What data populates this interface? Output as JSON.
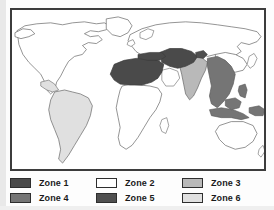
{
  "figure": {
    "type": "world-zone-map",
    "map": {
      "frame": true,
      "background_color": "#ffffff",
      "outline_color": "#555555"
    },
    "zone_colors": {
      "zone1": "#4a4a4a",
      "zone2": "#ffffff",
      "zone3": "#b9b9b9",
      "zone4": "#757575",
      "zone5": "#4f4f4f",
      "zone6": "#e0e0e0"
    },
    "regions": [
      {
        "name": "north-america",
        "zone": "zone2"
      },
      {
        "name": "greenland",
        "zone": "zone2"
      },
      {
        "name": "south-america",
        "zone": "zone6"
      },
      {
        "name": "central-america",
        "zone": "zone6"
      },
      {
        "name": "north-africa",
        "zone": "zone1"
      },
      {
        "name": "sub-saharan-africa",
        "zone": "zone2"
      },
      {
        "name": "middle-east",
        "zone": "zone1"
      },
      {
        "name": "arabian-peninsula",
        "zone": "zone2"
      },
      {
        "name": "india-subcontinent",
        "zone": "zone3"
      },
      {
        "name": "southeast-asia",
        "zone": "zone4"
      },
      {
        "name": "indonesia",
        "zone": "zone4"
      },
      {
        "name": "europe",
        "zone": "zone2"
      },
      {
        "name": "russia-northern-asia",
        "zone": "zone2"
      },
      {
        "name": "australia",
        "zone": "zone2"
      },
      {
        "name": "china-east-asia",
        "zone": "zone2"
      }
    ]
  },
  "legend": {
    "rows": [
      [
        {
          "id": "zone1",
          "label": "Zone 1",
          "color": "#4a4a4a"
        },
        {
          "id": "zone2",
          "label": "Zone 2",
          "color": "#ffffff"
        },
        {
          "id": "zone3",
          "label": "Zone 3",
          "color": "#b9b9b9"
        }
      ],
      [
        {
          "id": "zone4",
          "label": "Zone 4",
          "color": "#757575"
        },
        {
          "id": "zone5",
          "label": "Zone 5",
          "color": "#4f4f4f"
        },
        {
          "id": "zone6",
          "label": "Zone 6",
          "color": "#e0e0e0"
        }
      ]
    ]
  }
}
